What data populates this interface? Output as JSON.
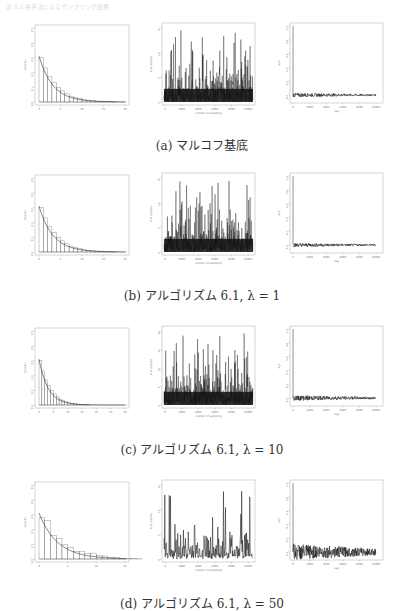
{
  "header": {
    "faint_text": "表 6.1 各手法によるサンプリング結果"
  },
  "figures": [
    {
      "id": "a",
      "caption": "(a) マルコフ基底",
      "top": 25,
      "caption_top": 136,
      "hist_xmax": 20,
      "hist_xticks": [
        "0",
        "5",
        "10",
        "15",
        "20"
      ],
      "bars": [
        0.3,
        0.23,
        0.17,
        0.13,
        0.1,
        0.075,
        0.055,
        0.04,
        0.03,
        0.022,
        0.016,
        0.012,
        0.009,
        0.006,
        0.004,
        0.003,
        0.002,
        0.001
      ],
      "noise": 0.0,
      "trace_ticks_y": [
        "0",
        "5",
        "10",
        "15"
      ],
      "acf_amp": 0.03
    },
    {
      "id": "b",
      "caption": "(b) アルゴリズム 6.1,  λ = 1",
      "top": 175,
      "caption_top": 286,
      "hist_xmax": 20,
      "hist_xticks": [
        "0",
        "5",
        "10",
        "15",
        "20"
      ],
      "bars": [
        0.3,
        0.23,
        0.17,
        0.13,
        0.1,
        0.075,
        0.055,
        0.04,
        0.03,
        0.022,
        0.016,
        0.012,
        0.009,
        0.006,
        0.004,
        0.003,
        0.002,
        0.001
      ],
      "noise": 0.0,
      "trace_ticks_y": [
        "0",
        "5",
        "10",
        "15"
      ],
      "acf_amp": 0.03
    },
    {
      "id": "c",
      "caption": "(c) アルゴリズム 6.1,  λ = 10",
      "top": 328,
      "caption_top": 440,
      "hist_xmax": 30,
      "hist_xticks": [
        "0",
        "5",
        "10",
        "15",
        "20",
        "25",
        "30"
      ],
      "bars": [
        0.3,
        0.23,
        0.17,
        0.13,
        0.1,
        0.075,
        0.055,
        0.04,
        0.03,
        0.022,
        0.016,
        0.012,
        0.009,
        0.006,
        0.004,
        0.003,
        0.002,
        0.001
      ],
      "noise": 0.0,
      "trace_ticks_y": [
        "0",
        "5",
        "10",
        "15",
        "20"
      ],
      "acf_amp": 0.04
    },
    {
      "id": "d",
      "caption": "(d) アルゴリズム 6.1,  λ = 50",
      "top": 482,
      "caption_top": 594,
      "hist_xmax": 15,
      "hist_xticks": [
        "0",
        "5",
        "10",
        "15"
      ],
      "bars": [
        0.28,
        0.26,
        0.16,
        0.14,
        0.1,
        0.08,
        0.05,
        0.05,
        0.035,
        0.04,
        0.025,
        0.02,
        0.012,
        0.008,
        0.005,
        0.003,
        0.002,
        0.001
      ],
      "noise": 1.0,
      "trace_ticks_y": [
        "0",
        "5",
        "10",
        "15"
      ],
      "acf_amp": 0.12
    }
  ],
  "chart_data": [
    {
      "type": "bar",
      "title": "",
      "xlabel": "",
      "ylabel": "Density",
      "yticks": [
        "0.0",
        "0.1",
        "0.2",
        "0.3",
        "0.4",
        "0.5"
      ],
      "note": "histogram with exponential density curve; panels a-d"
    },
    {
      "type": "line",
      "title": "",
      "xlabel": "number of sampling",
      "ylabel": "# of statistic",
      "xticks": [
        "0",
        "2000",
        "4000",
        "6000",
        "8000",
        "10000"
      ],
      "note": "trace plots of sampled values, panels a-d"
    },
    {
      "type": "line",
      "title": "",
      "xlabel": "Lag",
      "ylabel": "ACF",
      "xticks": [
        "0",
        "2000",
        "4000",
        "6000",
        "8000",
        "10000"
      ],
      "yticks": [
        "0.0",
        "0.2",
        "0.4",
        "0.6",
        "0.8",
        "1.0"
      ],
      "ylim": [
        0,
        1
      ],
      "note": "autocorrelation plots, panels a-d"
    }
  ],
  "labels": {
    "hist_ylabel": "Density",
    "hist_yticks": [
      "0.0",
      "0.1",
      "0.2",
      "0.3",
      "0.4",
      "0.5"
    ],
    "trace_xlabel": "number of sampling",
    "trace_ylabel": "# of statistic",
    "trace_xticks": [
      "0",
      "2000",
      "4000",
      "6000",
      "8000",
      "10000"
    ],
    "acf_xlabel": "Lag",
    "acf_ylabel": "ACF",
    "acf_xticks": [
      "0",
      "2000",
      "4000",
      "6000",
      "8000",
      "10000"
    ],
    "acf_yticks": [
      "0.0",
      "0.2",
      "0.4",
      "0.6",
      "0.8",
      "1.0"
    ]
  }
}
